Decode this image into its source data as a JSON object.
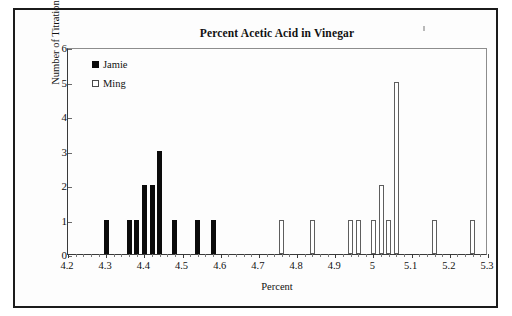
{
  "chart_data": {
    "type": "bar",
    "title": "Percent Acetic Acid in Vinegar",
    "xlabel": "Percent",
    "ylabel": "Number of Titrations",
    "xlim": [
      4.2,
      5.3
    ],
    "ylim": [
      0,
      6
    ],
    "x_tick_labels": [
      "4.2",
      "4.3",
      "4.4",
      "4.5",
      "4.6",
      "4.7",
      "4.8",
      "4.9",
      "5",
      "5.1",
      "5.2",
      "5.3"
    ],
    "x_tick_values": [
      4.2,
      4.3,
      4.4,
      4.5,
      4.6,
      4.7,
      4.8,
      4.9,
      5.0,
      5.1,
      5.2,
      5.3
    ],
    "x_minor_tick_step": 0.02,
    "y_tick_labels": [
      "0",
      "1",
      "2",
      "3",
      "4",
      "5",
      "6"
    ],
    "y_tick_values": [
      0,
      1,
      2,
      3,
      4,
      5,
      6
    ],
    "grid": false,
    "legend_position": "inside-top-left",
    "series": [
      {
        "name": "Jamie",
        "style": "filled",
        "color": "#0b0b0b",
        "x": [
          4.3,
          4.36,
          4.38,
          4.4,
          4.42,
          4.44,
          4.48,
          4.54,
          4.58
        ],
        "values": [
          1,
          1,
          1,
          2,
          2,
          3,
          1,
          1,
          1
        ]
      },
      {
        "name": "Ming",
        "style": "open",
        "color": "#ffffff",
        "x": [
          4.76,
          4.84,
          4.94,
          4.96,
          5.0,
          5.02,
          5.04,
          5.06,
          5.16,
          5.26
        ],
        "values": [
          1,
          1,
          1,
          1,
          1,
          2,
          1,
          5,
          1,
          1
        ]
      }
    ]
  },
  "legend": {
    "entries": [
      {
        "label": "Jamie",
        "swatch": "filled-square-icon"
      },
      {
        "label": "Ming",
        "swatch": "open-square-icon"
      }
    ]
  }
}
